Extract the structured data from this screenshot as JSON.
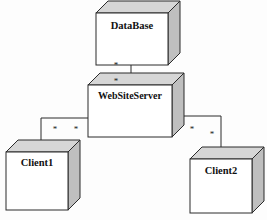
{
  "diagram": {
    "type": "uml-deployment-diagram",
    "title": "",
    "background_color": "#fdfdfd",
    "stroke_color": "#2b2b2b",
    "node_face_color": "#ffffff",
    "node_top_color": "#d6d6d6",
    "node_side_color": "#bfbfbf",
    "nodes": [
      {
        "id": "database",
        "label": "DataBase",
        "x": 96,
        "y": 13,
        "width": 72,
        "height": 52,
        "depth": 12,
        "label_x": 132,
        "label_y": 27
      },
      {
        "id": "websiteserver",
        "label": "WebSiteServer",
        "x": 88,
        "y": 85,
        "width": 84,
        "height": 52,
        "depth": 12,
        "label_x": 130,
        "label_y": 97
      },
      {
        "id": "client1",
        "label": "Client1",
        "x": 6,
        "y": 152,
        "width": 62,
        "height": 58,
        "depth": 12,
        "label_x": 37,
        "label_y": 164
      },
      {
        "id": "client2",
        "label": "Client2",
        "x": 190,
        "y": 159,
        "width": 62,
        "height": 54,
        "depth": 12,
        "label_x": 221,
        "label_y": 172
      }
    ],
    "links": [
      {
        "id": "link-database-websiteserver",
        "from": "database",
        "to": "websiteserver",
        "path": "M 131 65 L 131 85",
        "source_multiplicity": "*",
        "target_multiplicity": "*"
      },
      {
        "id": "link-websiteserver-client1",
        "from": "websiteserver",
        "to": "client1",
        "path": "M 88 118 L 41 118 L 41 152",
        "source_multiplicity": "*",
        "target_multiplicity": "*"
      },
      {
        "id": "link-websiteserver-client2",
        "from": "websiteserver",
        "to": "client2",
        "path": "M 184 116 L 221 116 L 221 159",
        "source_multiplicity": "*",
        "target_multiplicity": "*"
      }
    ],
    "multiplicity_markers": [
      {
        "id": "mult-db-lower",
        "text": "*",
        "x": 116,
        "y": 66
      },
      {
        "id": "mult-wss-upper",
        "text": "*",
        "x": 116,
        "y": 82
      },
      {
        "id": "mult-wss-left",
        "text": "*",
        "x": 76,
        "y": 130
      },
      {
        "id": "mult-client1",
        "text": "*",
        "x": 55,
        "y": 130
      },
      {
        "id": "mult-wss-right",
        "text": "*",
        "x": 192,
        "y": 130
      },
      {
        "id": "mult-client2",
        "text": "*",
        "x": 212,
        "y": 135
      }
    ]
  }
}
